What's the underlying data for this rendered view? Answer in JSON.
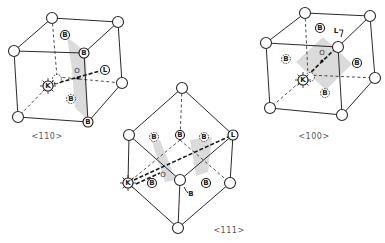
{
  "figure": {
    "panels": [
      {
        "id": "110",
        "caption": "<110>",
        "labels": {
          "K": "K",
          "L": "L",
          "O": "O",
          "B": "B"
        }
      },
      {
        "id": "111",
        "caption": "<111>",
        "labels": {
          "K": "K",
          "L": "L",
          "O": "O",
          "B": "B"
        }
      },
      {
        "id": "100",
        "caption": "<100>",
        "labels": {
          "K": "K",
          "L": "L",
          "O": "O",
          "B": "B"
        }
      }
    ]
  }
}
